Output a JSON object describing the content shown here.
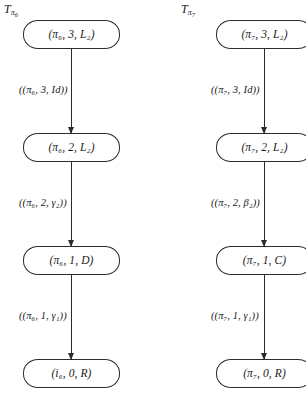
{
  "diagram": {
    "type": "two-column-flowchart",
    "background_color": "#ffffff",
    "stroke_color": "#2b2b2b",
    "columns": [
      {
        "id": "left",
        "title_base": "T",
        "title_sub_symbol": "π",
        "title_sub_index": "6",
        "nodes": [
          {
            "text": "(π₆, 3, L₂)"
          },
          {
            "text": "(π₆, 2, L₂)"
          },
          {
            "text": "(π₆, 1, D)"
          },
          {
            "text": "(i₆, 0, R)"
          }
        ],
        "edges": [
          {
            "label": "((π₆, 3, Id))"
          },
          {
            "label": "((π₆, 2, γ₂))"
          },
          {
            "label": "((π₆, 1, γ₁))"
          }
        ]
      },
      {
        "id": "right",
        "title_base": "T",
        "title_sub_symbol": "π",
        "title_sub_index": "7",
        "nodes": [
          {
            "text": "(π₇, 3, L₂)"
          },
          {
            "text": "(π₇, 2, L₂)"
          },
          {
            "text": "(π₇, 1, C)"
          },
          {
            "text": "(π₇, 0, R)"
          }
        ],
        "edges": [
          {
            "label": "((π₇, 3, Id))"
          },
          {
            "label": "((π₇, 2, β₂))"
          },
          {
            "label": "((π₇, 1, γ₁))"
          }
        ]
      }
    ]
  }
}
